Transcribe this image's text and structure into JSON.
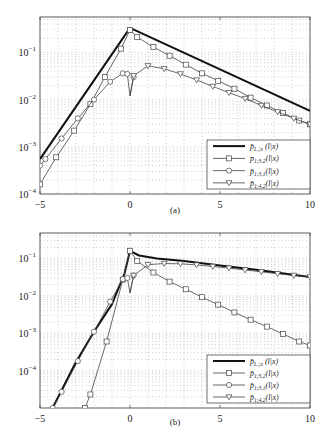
{
  "chart_data": [
    {
      "type": "line",
      "panel": "a",
      "caption": "(a)",
      "xlabel": "",
      "ylabel": "",
      "xlim": [
        -5,
        10
      ],
      "ylim_log10": [
        -4,
        -0.25
      ],
      "yscale": "log",
      "grid": "dotted-minor",
      "x_ticks": [
        -5,
        0,
        5,
        10
      ],
      "x_tick_labels": [
        "−5",
        "0",
        "5",
        "10"
      ],
      "y_ticks_log10": [
        -1,
        -2,
        -3,
        -4
      ],
      "y_tick_labels": [
        [
          "10",
          "−1"
        ],
        [
          "10",
          "−2"
        ],
        [
          "10",
          "−3"
        ],
        [
          "10",
          "−4"
        ]
      ],
      "legend_position": "lower right",
      "series": [
        {
          "name": "p̄_{L1|x}(l|x)",
          "marker": "none",
          "width": 2.0,
          "x": [
            -5,
            0,
            10
          ],
          "y": [
            0.00055,
            0.33,
            0.0058
          ]
        },
        {
          "name": "p̄_{1;3,2}(l|x)",
          "marker": "square",
          "width": 0.8,
          "x": [
            -5,
            -4.1,
            -3.1,
            -2.2,
            -1.4,
            -0.5,
            0,
            0.4,
            1.3,
            2.2,
            3.1,
            4.0,
            4.9,
            5.8,
            6.7,
            7.6,
            8.5,
            9.4,
            10
          ],
          "y": [
            0.00016,
            0.0006,
            0.0022,
            0.008,
            0.03,
            0.12,
            0.3,
            0.21,
            0.13,
            0.085,
            0.055,
            0.036,
            0.025,
            0.017,
            0.011,
            0.0075,
            0.0052,
            0.0036,
            0.003
          ]
        },
        {
          "name": "p̄_{1;3,1}(l|x)",
          "marker": "circle",
          "width": 0.8,
          "x": [
            -5,
            -4.7,
            -3.8,
            -2.9,
            -2.0,
            -1.1,
            -0.4,
            -0.15,
            0,
            0.2
          ],
          "y": [
            0.0004,
            0.00055,
            0.0015,
            0.004,
            0.01,
            0.024,
            0.036,
            0.035,
            0.012,
            0.03
          ]
        },
        {
          "name": "p̄_{1;4,2}(l|x)",
          "marker": "triangle-down",
          "width": 0.8,
          "x": [
            0,
            0.2,
            1.0,
            1.9,
            2.8,
            3.7,
            4.6,
            5.5,
            6.4,
            7.3,
            8.2,
            9.1,
            10
          ],
          "y": [
            0.012,
            0.032,
            0.052,
            0.045,
            0.035,
            0.026,
            0.019,
            0.014,
            0.0105,
            0.0075,
            0.0055,
            0.004,
            0.003
          ]
        }
      ]
    },
    {
      "type": "line",
      "panel": "b",
      "caption": "(b)",
      "xlabel": "",
      "ylabel": "",
      "xlim": [
        -5,
        10
      ],
      "ylim_log10": [
        -5,
        -0.32
      ],
      "yscale": "log",
      "grid": "dotted-minor",
      "x_ticks": [
        -5,
        0,
        5,
        10
      ],
      "x_tick_labels": [
        "−5",
        "0",
        "5",
        "10"
      ],
      "y_ticks_log10": [
        -1,
        -2,
        -3,
        -4
      ],
      "y_tick_labels": [
        [
          "10",
          "−1"
        ],
        [
          "10",
          "−2"
        ],
        [
          "10",
          "−3"
        ],
        [
          "10",
          "−4"
        ]
      ],
      "legend_position": "lower right",
      "series": [
        {
          "name": "p̄_{L1|x}(l|x)",
          "marker": "none",
          "width": 2.0,
          "x": [
            -4.3,
            -3.0,
            -2.0,
            -1.0,
            -0.3,
            0,
            0.5,
            1.5,
            3,
            5,
            7,
            10
          ],
          "y": [
            1e-05,
            0.00017,
            0.0011,
            0.006,
            0.04,
            0.16,
            0.12,
            0.1,
            0.085,
            0.065,
            0.05,
            0.032
          ]
        },
        {
          "name": "p̄_{1;3,2}(l|x)",
          "marker": "square",
          "width": 0.8,
          "x": [
            -2.5,
            -2.2,
            -1.3,
            -0.4,
            0,
            0.4,
            1.3,
            2.2,
            3.1,
            4.0,
            4.9,
            5.8,
            6.7,
            7.6,
            8.5,
            9.4,
            10
          ],
          "y": [
            1e-05,
            2.3e-05,
            0.0006,
            0.027,
            0.16,
            0.085,
            0.042,
            0.024,
            0.015,
            0.0092,
            0.0058,
            0.0036,
            0.0023,
            0.0015,
            0.00095,
            0.0006,
            0.00047
          ]
        },
        {
          "name": "p̄_{1;3,1}(l|x)",
          "marker": "circle",
          "width": 0.8,
          "x": [
            -4.3,
            -3.8,
            -2.9,
            -2.0,
            -1.1,
            -0.4,
            -0.15,
            0,
            0.2
          ],
          "y": [
            1e-05,
            2.7e-05,
            0.00018,
            0.0011,
            0.007,
            0.028,
            0.03,
            0.012,
            0.035
          ]
        },
        {
          "name": "p̄_{1;4,2}(l|x)",
          "marker": "triangle-down",
          "width": 0.8,
          "x": [
            0,
            0.2,
            1.0,
            1.9,
            2.8,
            3.7,
            4.6,
            5.5,
            6.4,
            7.3,
            8.2,
            9.1,
            10
          ],
          "y": [
            0.012,
            0.035,
            0.068,
            0.073,
            0.072,
            0.067,
            0.061,
            0.055,
            0.049,
            0.044,
            0.039,
            0.035,
            0.032
          ]
        }
      ]
    }
  ],
  "panels": [
    {
      "frame": {
        "left": 40,
        "top": 17,
        "right": 310,
        "bottom": 194
      },
      "legend": {
        "left": 207,
        "top": 140,
        "right": 310,
        "bottom": 189
      },
      "caption_y": 213
    },
    {
      "frame": {
        "left": 40,
        "top": 233,
        "right": 310,
        "bottom": 408
      },
      "legend": {
        "left": 207,
        "top": 355,
        "right": 310,
        "bottom": 403
      },
      "caption_y": 425
    }
  ],
  "legend_labels": [
    {
      "base": "p̄",
      "sub": "L₁|x",
      "arg": " (l|x)"
    },
    {
      "base": "p̄",
      "sub": "1;3,2",
      "arg": "(l|x)"
    },
    {
      "base": "p̄",
      "sub": "1;3,1",
      "arg": "(l|x)"
    },
    {
      "base": "p̄",
      "sub": "1;4,2",
      "arg": "(l|x)"
    }
  ],
  "colors": {
    "axis": "#333333",
    "grid": "#9a9a9a",
    "thick_line": "#111111",
    "thin_line": "#444444",
    "marker_fill": "#ffffff"
  }
}
